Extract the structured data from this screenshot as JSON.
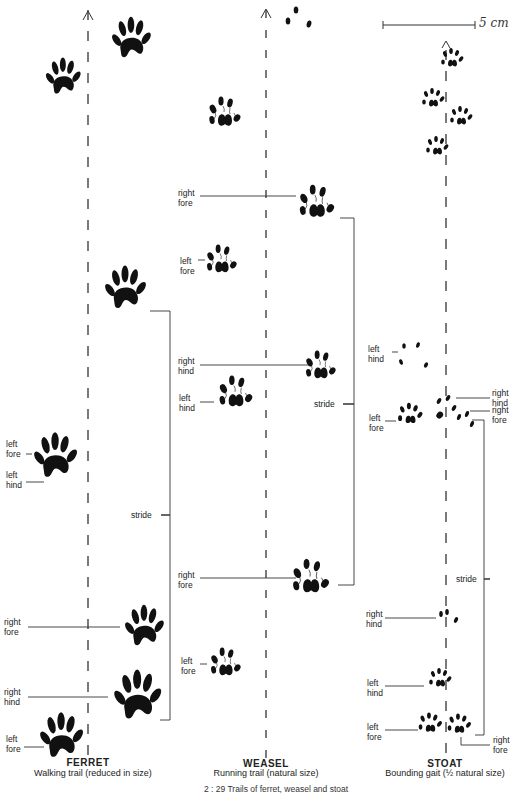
{
  "figure": {
    "caption": "2 : 29   Trails of ferret, weasel and stoat",
    "scale_bar": {
      "label": "5 cm",
      "length_px": 100
    },
    "ink_color": "#111111",
    "background": "#ffffff"
  },
  "ferret": {
    "title": "FERRET",
    "subtitle": "Walking trail (reduced in size)",
    "labels": {
      "left_fore_1": "left\nfore",
      "left_hind": "left\nhind",
      "stride": "stride",
      "right_fore": "right\nfore",
      "right_hind": "right\nhind",
      "left_fore_2": "left\nfore"
    }
  },
  "weasel": {
    "title": "WEASEL",
    "subtitle": "Running trail (natural size)",
    "labels": {
      "right_fore_1": "right\nfore",
      "left_fore_1": "left\nfore",
      "right_hind": "right\nhind",
      "left_hind": "left\nhind",
      "stride": "stride",
      "right_fore_2": "right\nfore",
      "left_fore_2": "left\nfore"
    }
  },
  "stoat": {
    "title": "STOAT",
    "subtitle": "Bounding gait (½ natural size)",
    "labels": {
      "left_hind_1": "left\nhind",
      "right_hind_1": "right\nhind",
      "right_fore_1": "right\nfore",
      "left_fore_1": "left\nfore",
      "stride": "stride",
      "right_hind_2": "right\nhind",
      "left_hind_2": "left\nhind",
      "left_fore_2": "left\nfore",
      "right_fore_2": "right\nfore"
    }
  }
}
